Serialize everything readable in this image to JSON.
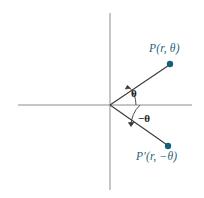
{
  "figure": {
    "kind": "polar-coordinate-diagram",
    "background_color": "#ffffff",
    "axis_color": "#8c8c8c",
    "ray_color": "#3a3a3a",
    "point_color": "#17607a",
    "label_color": "#1f5f7a",
    "angle_label_color": "#1a1a1a",
    "axes": {
      "origin_x": 110,
      "origin_y": 105,
      "x_axis_start": 18,
      "x_axis_end": 192,
      "y_axis_start": 13,
      "y_axis_end": 190
    },
    "points": [
      {
        "name": "P",
        "label": "P(r, θ)",
        "label_parts": {
          "p": "P",
          "open": "(",
          "r": "r",
          "comma": ", ",
          "theta": "θ",
          "close": ")"
        },
        "x": 170,
        "y": 64,
        "dot_radius": 3.2
      },
      {
        "name": "P-prime",
        "label": "P′(r, −θ)",
        "label_parts": {
          "p": "P′",
          "open": "(",
          "r": "r",
          "comma": ", ",
          "theta": "−θ",
          "close": ")"
        },
        "x": 168,
        "y": 146,
        "dot_radius": 3.2
      }
    ],
    "angles": [
      {
        "name": "theta",
        "label": "θ",
        "arc_radius": 26,
        "direction": "counterclockwise-from-axis"
      },
      {
        "name": "negative-theta",
        "label": "−θ",
        "arc_radius": 30,
        "direction": "clockwise-from-axis"
      }
    ]
  }
}
